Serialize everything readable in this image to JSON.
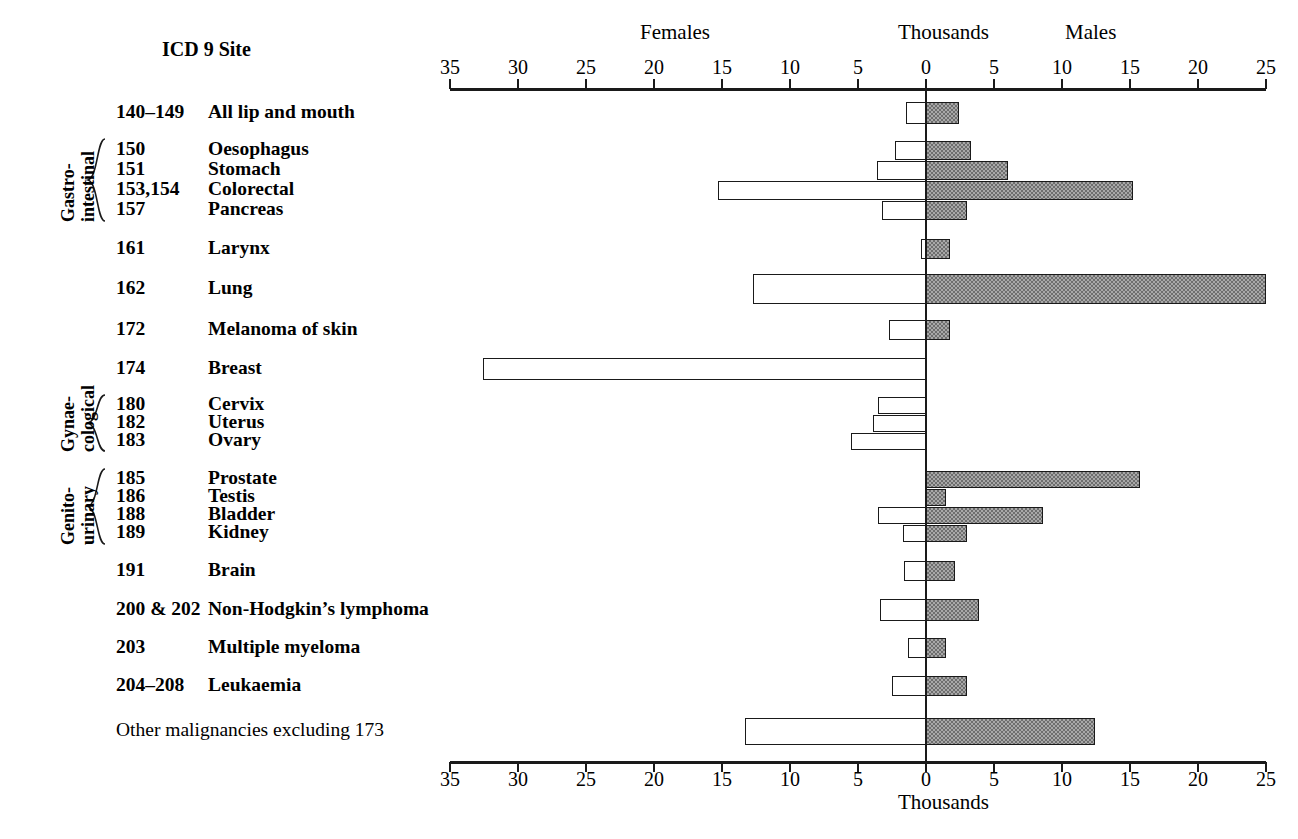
{
  "header": {
    "left_label": "Females",
    "center_label": "Thousands",
    "right_label": "Males",
    "site_header": "ICD 9 Site",
    "bottom_label": "Thousands"
  },
  "axis": {
    "tick_labels": [
      "35",
      "30",
      "25",
      "20",
      "15",
      "10",
      "5",
      "0",
      "5",
      "10",
      "15",
      "20",
      "25"
    ],
    "female_max": 35,
    "male_max": 25,
    "unit": "Thousands",
    "grid": false
  },
  "groups": [
    {
      "caption_line1": "Gastro-",
      "caption_line2": "intestinal"
    },
    {
      "caption_line1": "Gynae-",
      "caption_line2": "cological"
    },
    {
      "caption_line1": "Genito-",
      "caption_line2": "urinary"
    }
  ],
  "chart_data": {
    "type": "bar",
    "title": "",
    "subtitle": "",
    "xlabel": "Thousands",
    "ylabel": "ICD 9 Site",
    "orientation": "horizontal-diverging",
    "legend": [
      "Females",
      "Males"
    ],
    "legend_position": "top",
    "xlim_left": [
      0,
      35
    ],
    "xlim_right": [
      0,
      25
    ],
    "xticks_left": [
      35,
      30,
      25,
      20,
      15,
      10,
      5,
      0
    ],
    "xticks_right": [
      0,
      5,
      10,
      15,
      20,
      25
    ],
    "categories": [
      "All lip and mouth",
      "Oesophagus",
      "Stomach",
      "Colorectal",
      "Pancreas",
      "Larynx",
      "Lung",
      "Melanoma of skin",
      "Breast",
      "Cervix",
      "Uterus",
      "Ovary",
      "Prostate",
      "Testis",
      "Bladder",
      "Kidney",
      "Brain",
      "Non-Hodgkin's lymphoma",
      "Multiple myeloma",
      "Leukaemia",
      "Other malignancies excluding 173"
    ],
    "series": [
      {
        "name": "Females",
        "values": [
          1.5,
          2.3,
          3.6,
          15.3,
          3.2,
          0.4,
          12.7,
          2.7,
          32.6,
          3.5,
          3.9,
          5.5,
          0,
          0,
          3.5,
          1.7,
          1.6,
          3.4,
          1.3,
          2.5,
          13.3
        ]
      },
      {
        "name": "Males",
        "values": [
          2.4,
          3.3,
          6.0,
          15.2,
          3.0,
          1.8,
          25.0,
          1.8,
          0,
          0,
          0,
          0,
          15.7,
          1.5,
          8.6,
          3.0,
          2.1,
          3.9,
          1.5,
          3.0,
          12.4
        ]
      }
    ]
  },
  "rows": [
    {
      "code": "140–149",
      "name": "All lip and mouth",
      "female": 1.5,
      "male": 2.4,
      "group": null
    },
    {
      "code": "150",
      "name": "Oesophagus",
      "female": 2.3,
      "male": 3.3,
      "group": "Gastro-intestinal"
    },
    {
      "code": "151",
      "name": "Stomach",
      "female": 3.6,
      "male": 6.0,
      "group": "Gastro-intestinal"
    },
    {
      "code": "153,154",
      "name": "Colorectal",
      "female": 15.3,
      "male": 15.2,
      "group": "Gastro-intestinal"
    },
    {
      "code": "157",
      "name": "Pancreas",
      "female": 3.2,
      "male": 3.0,
      "group": "Gastro-intestinal"
    },
    {
      "code": "161",
      "name": "Larynx",
      "female": 0.4,
      "male": 1.8,
      "group": null
    },
    {
      "code": "162",
      "name": "Lung",
      "female": 12.7,
      "male": 25.0,
      "group": null
    },
    {
      "code": "172",
      "name": "Melanoma of skin",
      "female": 2.7,
      "male": 1.8,
      "group": null
    },
    {
      "code": "174",
      "name": "Breast",
      "female": 32.6,
      "male": 0,
      "group": null
    },
    {
      "code": "180",
      "name": "Cervix",
      "female": 3.5,
      "male": 0,
      "group": "Gynaecological"
    },
    {
      "code": "182",
      "name": "Uterus",
      "female": 3.9,
      "male": 0,
      "group": "Gynaecological"
    },
    {
      "code": "183",
      "name": "Ovary",
      "female": 5.5,
      "male": 0,
      "group": "Gynaecological"
    },
    {
      "code": "185",
      "name": "Prostate",
      "female": 0,
      "male": 15.7,
      "group": "Genito-urinary"
    },
    {
      "code": "186",
      "name": "Testis",
      "female": 0,
      "male": 1.5,
      "group": "Genito-urinary"
    },
    {
      "code": "188",
      "name": "Bladder",
      "female": 3.5,
      "male": 8.6,
      "group": "Genito-urinary"
    },
    {
      "code": "189",
      "name": "Kidney",
      "female": 1.7,
      "male": 3.0,
      "group": "Genito-urinary"
    },
    {
      "code": "191",
      "name": "Brain",
      "female": 1.6,
      "male": 2.1,
      "group": null
    },
    {
      "code": "200 & 202",
      "name": "Non-Hodgkin’s lymphoma",
      "female": 3.4,
      "male": 3.9,
      "group": null
    },
    {
      "code": "203",
      "name": "Multiple myeloma",
      "female": 1.3,
      "male": 1.5,
      "group": null
    },
    {
      "code": "204–208",
      "name": "Leukaemia",
      "female": 2.5,
      "male": 3.0,
      "group": null
    },
    {
      "code": "",
      "name": "Other malignancies excluding 173",
      "female": 13.3,
      "male": 12.4,
      "group": null
    }
  ],
  "colors": {
    "male_fill": "#a8a8a8",
    "female_fill": "#ffffff",
    "ink": "#1a1a1a"
  }
}
